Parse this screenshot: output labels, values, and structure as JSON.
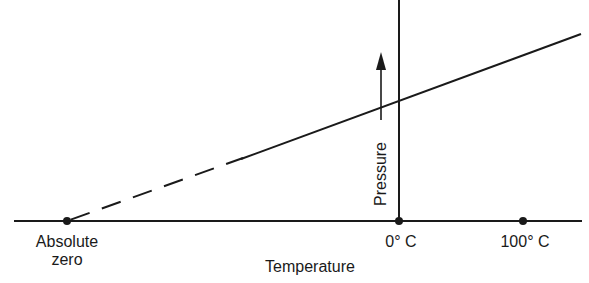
{
  "diagram": {
    "type": "line",
    "x_axis_label": "Temperature",
    "y_axis_label": "Pressure",
    "points": [
      {
        "label": "Absolute zero",
        "label_line1": "Absolute",
        "label_line2": "zero"
      },
      {
        "label": "0° C"
      },
      {
        "label": "100° C"
      }
    ],
    "line_segments": [
      {
        "style": "dashed",
        "from": "Absolute zero",
        "to": "measured range start"
      },
      {
        "style": "solid",
        "from": "measured range start",
        "to": "beyond 100° C"
      }
    ],
    "colors": {
      "ink": "#1a1a1a",
      "background": "#ffffff"
    }
  }
}
